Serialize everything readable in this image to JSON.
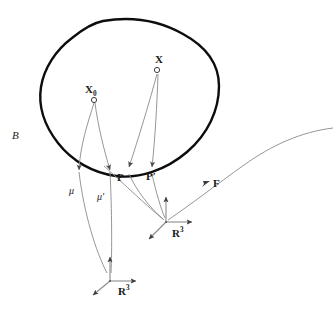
{
  "figure": {
    "kind": "mathematical-diagram",
    "background_color": "#ffffff",
    "stroke_colors": {
      "body_outline": "#0d0d0d",
      "thin_curve": "#8a8a8a",
      "axis": "#8a8a8a",
      "text": "#1a1a1a"
    }
  },
  "labels": {
    "body": "B",
    "point_x0_base": "X",
    "point_x0_sub": "0",
    "point_x": "X",
    "placement_mu": "μ",
    "placement_mu_prime_base": "μ",
    "placement_mu_prime_mark": "′",
    "image_p": "P",
    "image_p_prime_base": "P",
    "image_p_prime_mark": "′",
    "map_f": "F",
    "space_r3_base": "R",
    "space_r3_exp": "3",
    "space_r3_lower_base": "R",
    "space_r3_lower_exp": "3"
  },
  "label_positions": {
    "body": {
      "x": 12,
      "y": 137
    },
    "point_x0": {
      "x": 85,
      "y": 91
    },
    "point_x": {
      "x": 155,
      "y": 71
    },
    "placement_mu": {
      "x": 70,
      "y": 193
    },
    "placement_mu_prime": {
      "x": 97,
      "y": 199
    },
    "image_p": {
      "x": 117,
      "y": 180
    },
    "image_p_prime": {
      "x": 146,
      "y": 179
    },
    "map_f": {
      "x": 213,
      "y": 185
    },
    "space_r3_right": {
      "x": 172,
      "y": 234
    },
    "space_r3_lower": {
      "x": 118,
      "y": 292
    }
  },
  "markers": {
    "x0_circle": {
      "cx": 94,
      "cy": 100,
      "r": 2.6
    },
    "x_circle": {
      "cx": 157,
      "cy": 70,
      "r": 2.6
    }
  },
  "body_outline": "M 103,21 C 132,16 160,21 183,34 C 205,46 219,62 219,86 C 219,110 208,134 187,152 C 166,170 139,179 116,176 C 93,173 72,161 58,143 C 44,125 38,106 41,87 C 44,68 56,50 72,38 C 83,29 93,23 103,21 Z",
  "curves": {
    "mu_from_x0": "M 94,103 C 88,122 80,146 79,170",
    "mu_prime_from_x0": "M 95,103 C 97,126 103,150 110,170",
    "p_from_x": "M 157,74 C 150,100 138,140 129,168",
    "p_prime_from_x": "M 158,74 C 157,104 155,140 152,168",
    "mu_tail_to_lower": "M 79,177 C 84,215 96,252 107,272",
    "mu_prime_tail_to_lower": "M 110,177 C 112,212 112,248 111,272",
    "p_tail_to_right": "M 129,175 C 136,190 150,208 163,219",
    "p_prime_tail_to_right": "M 152,175 C 155,192 160,209 165,218",
    "cross_from_body_to_right": "M 105,167 C 125,185 148,206 164,220",
    "f_curve": "M 168,220 C 190,205 215,186 243,166 C 271,146 300,133 330,129"
  },
  "arrowheads": [
    {
      "name": "mu-arrow",
      "x": 79,
      "y": 170,
      "angle": -78
    },
    {
      "name": "mu-prime-arrow",
      "x": 110,
      "y": 170,
      "angle": -70
    },
    {
      "name": "p-arrow",
      "x": 129,
      "y": 168,
      "angle": -72
    },
    {
      "name": "p-prime-arrow",
      "x": 152,
      "y": 168,
      "angle": -82
    },
    {
      "name": "f-arrow",
      "x": 207,
      "y": 183,
      "angle": -38
    }
  ],
  "frames": {
    "right_r3": {
      "origin": {
        "x": 166,
        "y": 222
      },
      "axes": [
        {
          "name": "vertical-axis",
          "x2": 166,
          "y2": 196
        },
        {
          "name": "horizontal-axis",
          "x2": 193,
          "y2": 222
        },
        {
          "name": "diagonal-axis",
          "x2": 148,
          "y2": 240
        }
      ]
    },
    "lower_r3": {
      "origin": {
        "x": 110,
        "y": 281
      },
      "axes": [
        {
          "name": "vertical-axis",
          "x2": 110,
          "y2": 256
        },
        {
          "name": "horizontal-axis",
          "x2": 137,
          "y2": 281
        },
        {
          "name": "diagonal-axis",
          "x2": 92,
          "y2": 296
        }
      ]
    }
  }
}
